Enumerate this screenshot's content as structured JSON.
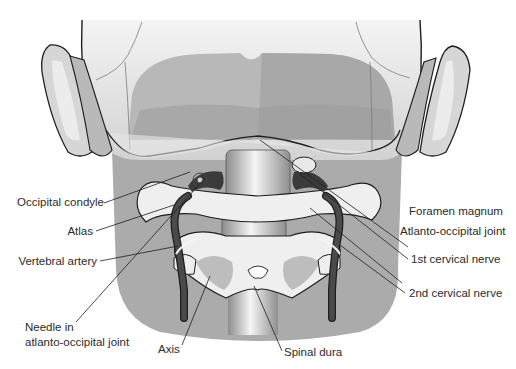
{
  "figure": {
    "colors": {
      "background": "#ffffff",
      "neck_fill": "#a9a9a9",
      "skull_light": "#e6e6e6",
      "skull_mid": "#c9c9c9",
      "skull_dark": "#9e9e9e",
      "bone_light": "#efefef",
      "artery": "#3a3a3a",
      "outline": "#1e1e1e",
      "leader_line": "#1e1e1e",
      "label_text": "#2b2b2b"
    }
  },
  "labels": {
    "left": [
      {
        "id": "occipital-condyle",
        "text": "Occipital condyle"
      },
      {
        "id": "atlas",
        "text": "Atlas"
      },
      {
        "id": "vertebral-artery",
        "text": "Vertebral artery"
      },
      {
        "id": "needle-line1",
        "text": "Needle in"
      },
      {
        "id": "needle-line2",
        "text": "atlanto-occipital joint"
      }
    ],
    "right": [
      {
        "id": "foramen-magnum",
        "text": "Foramen magnum"
      },
      {
        "id": "atlanto-occipital-joint",
        "text": "Atlanto-occipital joint"
      },
      {
        "id": "first-cervical-nerve",
        "text": "1st cervical nerve"
      },
      {
        "id": "second-cervical-nerve",
        "text": "2nd cervical nerve"
      }
    ],
    "bottom": [
      {
        "id": "axis",
        "text": "Axis"
      },
      {
        "id": "spinal-dura",
        "text": "Spinal dura"
      }
    ]
  }
}
